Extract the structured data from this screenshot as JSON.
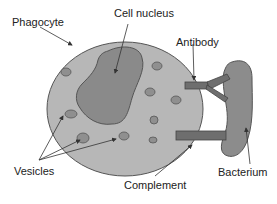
{
  "labels": {
    "phagocyte": "Phagocyte",
    "cell_nucleus": "Cell nucleus",
    "antibody": "Antibody",
    "vesicles": "Vesicles",
    "complement": "Complement",
    "bacterium": "Bacterium"
  },
  "colors": {
    "cell_fill": "#b7b7b7",
    "nucleus_fill": "#8a8a8a",
    "vesicle_fill": "#8f8f8f",
    "bacterium_fill": "#8c8c8c",
    "connector_fill": "#6e6e6e",
    "outline": "#555555",
    "arrow": "#333333"
  }
}
